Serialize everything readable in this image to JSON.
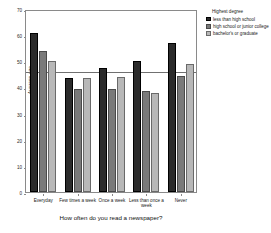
{
  "chart_data": {
    "type": "bar",
    "title": "",
    "xlabel": "How often do you read a newspaper?",
    "ylabel": "Average age",
    "ylim": [
      0,
      70
    ],
    "yticks": [
      0,
      10,
      20,
      30,
      40,
      50,
      60,
      70
    ],
    "ytick_labels": [
      "0",
      "10",
      "20",
      "30",
      "40",
      "50",
      "60",
      "70"
    ],
    "grid": false,
    "legend_position": "right",
    "legend_title": "Highest degree",
    "categories": [
      "Everyday",
      "Few times a week",
      "Once a week",
      "Less than once a week",
      "Never"
    ],
    "series": [
      {
        "name": "less than high school",
        "color": "#2b2b2b",
        "values": [
          61,
          43.5,
          47.5,
          50,
          57
        ]
      },
      {
        "name": "high school or junior college",
        "color": "#7a7a7a",
        "values": [
          54,
          39.5,
          39.5,
          38.5,
          44.5
        ]
      },
      {
        "name": "bachelor's or graduate",
        "color": "#b8b8b8",
        "values": [
          50,
          43.5,
          44,
          38,
          49
        ]
      }
    ],
    "reference_line": {
      "value": 46.5,
      "color": "#707070"
    }
  }
}
